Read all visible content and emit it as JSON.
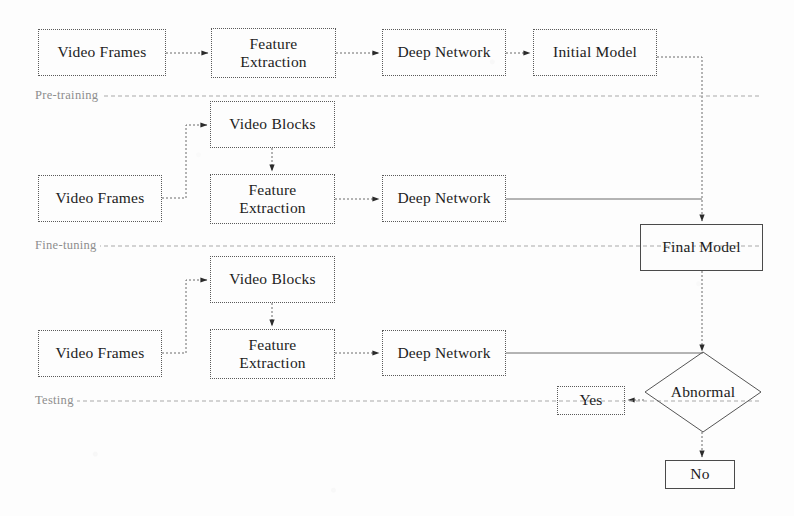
{
  "diagram": {
    "colors": {
      "background": "#fdfdfd",
      "box_border_dotted": "#5a5a5a",
      "box_border_solid": "#4a4a4a",
      "text": "#1c1c1c",
      "divider_label": "#8d8d8d",
      "wire": "#6b6b6b"
    },
    "sections": [
      {
        "id": "pre-training",
        "label": "Pre-training"
      },
      {
        "id": "fine-tuning",
        "label": "Fine-tuning"
      },
      {
        "id": "testing",
        "label": "Testing"
      }
    ],
    "nodes": [
      {
        "id": "video-frames-1",
        "label": "Video Frames",
        "shape": "rect",
        "border": "dotted",
        "x": 38,
        "y": 29,
        "w": 128,
        "h": 47
      },
      {
        "id": "feature-extraction-1",
        "label": "Feature\nExtraction",
        "shape": "rect",
        "border": "dotted",
        "x": 211,
        "y": 28,
        "w": 125,
        "h": 50
      },
      {
        "id": "deep-network-1",
        "label": "Deep Network",
        "shape": "rect",
        "border": "dotted",
        "x": 382,
        "y": 29,
        "w": 124,
        "h": 47
      },
      {
        "id": "initial-model",
        "label": "Initial Model",
        "shape": "rect",
        "border": "dotted",
        "x": 533,
        "y": 29,
        "w": 124,
        "h": 47
      },
      {
        "id": "video-blocks-2",
        "label": "Video Blocks",
        "shape": "rect",
        "border": "dotted",
        "x": 210,
        "y": 101,
        "w": 125,
        "h": 47
      },
      {
        "id": "video-frames-2",
        "label": "Video Frames",
        "shape": "rect",
        "border": "dotted",
        "x": 38,
        "y": 175,
        "w": 124,
        "h": 47
      },
      {
        "id": "feature-extraction-2",
        "label": "Feature\nExtraction",
        "shape": "rect",
        "border": "dotted",
        "x": 210,
        "y": 174,
        "w": 125,
        "h": 50
      },
      {
        "id": "deep-network-2",
        "label": "Deep Network",
        "shape": "rect",
        "border": "dotted",
        "x": 382,
        "y": 175,
        "w": 124,
        "h": 47
      },
      {
        "id": "final-model",
        "label": "Final Model",
        "shape": "rect",
        "border": "solid",
        "x": 640,
        "y": 224,
        "w": 123,
        "h": 47
      },
      {
        "id": "video-blocks-3",
        "label": "Video Blocks",
        "shape": "rect",
        "border": "dotted",
        "x": 210,
        "y": 256,
        "w": 125,
        "h": 47
      },
      {
        "id": "video-frames-3",
        "label": "Video Frames",
        "shape": "rect",
        "border": "dotted",
        "x": 38,
        "y": 330,
        "w": 124,
        "h": 47
      },
      {
        "id": "feature-extraction-3",
        "label": "Feature\nExtraction",
        "shape": "rect",
        "border": "dotted",
        "x": 210,
        "y": 329,
        "w": 125,
        "h": 50
      },
      {
        "id": "deep-network-3",
        "label": "Deep Network",
        "shape": "rect",
        "border": "dotted",
        "x": 382,
        "y": 330,
        "w": 124,
        "h": 46
      },
      {
        "id": "abnormal-decision",
        "label": "Abnormal",
        "shape": "diamond",
        "border": "solid",
        "x": 645,
        "y": 352,
        "w": 116,
        "h": 80
      },
      {
        "id": "yes-box",
        "label": "Yes",
        "shape": "rect",
        "border": "dotted",
        "x": 557,
        "y": 386,
        "w": 68,
        "h": 29
      },
      {
        "id": "no-box",
        "label": "No",
        "shape": "rect",
        "border": "solid",
        "x": 665,
        "y": 460,
        "w": 70,
        "h": 29
      }
    ],
    "edges": [
      {
        "from": "video-frames-1",
        "to": "feature-extraction-1",
        "style": "dotted",
        "arrow": true
      },
      {
        "from": "feature-extraction-1",
        "to": "deep-network-1",
        "style": "dotted",
        "arrow": true
      },
      {
        "from": "deep-network-1",
        "to": "initial-model",
        "style": "dotted",
        "arrow": true
      },
      {
        "from": "initial-model",
        "to": "final-model",
        "style": "dotted",
        "arrow": true
      },
      {
        "from": "video-frames-2",
        "to": "video-blocks-2",
        "style": "dotted",
        "arrow": true
      },
      {
        "from": "video-blocks-2",
        "to": "feature-extraction-2",
        "style": "dotted",
        "arrow": true
      },
      {
        "from": "feature-extraction-2",
        "to": "deep-network-2",
        "style": "dotted",
        "arrow": true
      },
      {
        "from": "deep-network-2",
        "to": "final-model",
        "style": "solid",
        "arrow": false
      },
      {
        "from": "video-frames-3",
        "to": "video-blocks-3",
        "style": "dotted",
        "arrow": true
      },
      {
        "from": "video-blocks-3",
        "to": "feature-extraction-3",
        "style": "dotted",
        "arrow": true
      },
      {
        "from": "feature-extraction-3",
        "to": "deep-network-3",
        "style": "dotted",
        "arrow": true
      },
      {
        "from": "deep-network-3",
        "to": "abnormal-decision",
        "style": "solid",
        "arrow": false
      },
      {
        "from": "final-model",
        "to": "abnormal-decision",
        "style": "dotted",
        "arrow": true
      },
      {
        "from": "abnormal-decision",
        "to": "yes-box",
        "style": "dotted",
        "arrow": true
      },
      {
        "from": "abnormal-decision",
        "to": "no-box",
        "style": "dotted",
        "arrow": true
      }
    ]
  }
}
